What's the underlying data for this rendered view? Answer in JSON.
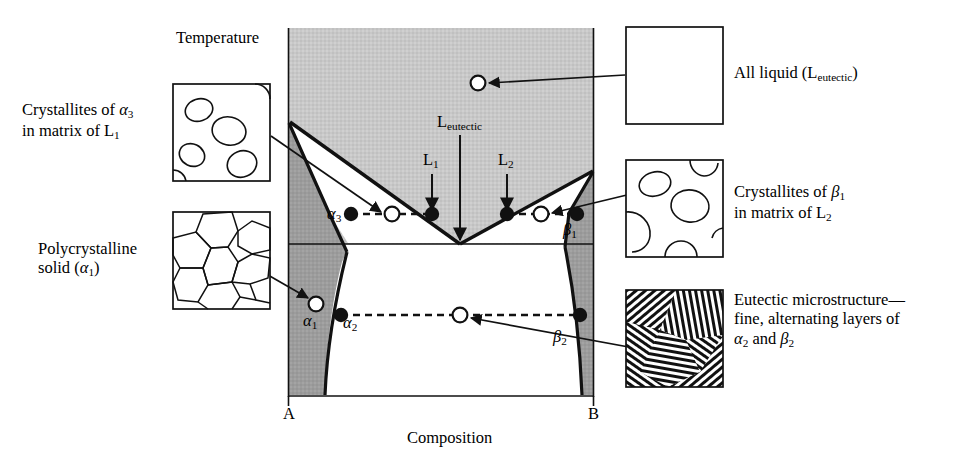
{
  "figure": {
    "type": "eutectic-phase-diagram",
    "axis": {
      "y_title": "Temperature",
      "x_title": "Composition",
      "x_left_tick": "A",
      "x_right_tick": "B"
    },
    "in_diagram_labels": [
      {
        "id": "L_eutectic",
        "base": "L",
        "sub": "eutectic",
        "x": 451,
        "y": 122
      },
      {
        "id": "L1",
        "base": "L",
        "sub": "1",
        "x": 424,
        "y": 160
      },
      {
        "id": "L2",
        "base": "L",
        "sub": "2",
        "x": 500,
        "y": 160
      },
      {
        "id": "alpha3",
        "base": "α",
        "sub": "3",
        "x": 329,
        "y": 207
      },
      {
        "id": "beta1",
        "base": "β",
        "sub": "1",
        "x": 561,
        "y": 225
      },
      {
        "id": "alpha1",
        "base": "α",
        "sub": "1",
        "x": 305,
        "y": 316
      },
      {
        "id": "alpha2",
        "base": "α",
        "sub": "2",
        "x": 345,
        "y": 318
      },
      {
        "id": "beta2",
        "base": "β",
        "sub": "2",
        "x": 552,
        "y": 332
      }
    ],
    "callouts": [
      {
        "id": "all-liquid",
        "side": "right",
        "lines": [
          {
            "text": "All liquid (L",
            "sub": "eutectic",
            "tail": ")"
          }
        ],
        "swatch": "blank",
        "text_x": 733,
        "text_y": 70
      },
      {
        "id": "crystallites-alpha3",
        "side": "left",
        "lines": [
          {
            "text": "Crystallites of ",
            "ital": "α",
            "sub": "3",
            "tail": ""
          },
          {
            "text": "in matrix of L",
            "sub": "1",
            "tail": ""
          }
        ],
        "swatch": "blobs",
        "text_x": 22,
        "text_y": 108
      },
      {
        "id": "polycrystalline-alpha1",
        "side": "left",
        "lines": [
          {
            "text": "Polycrystalline",
            "sub": "",
            "tail": ""
          },
          {
            "text": "solid (",
            "ital": "α",
            "sub": "1",
            "tail": ")"
          }
        ],
        "swatch": "grains",
        "text_x": 38,
        "text_y": 248
      },
      {
        "id": "crystallites-beta1",
        "side": "right",
        "lines": [
          {
            "text": "Crystallites of ",
            "ital": "β",
            "sub": "1",
            "tail": ""
          },
          {
            "text": "in matrix of L",
            "sub": "2",
            "tail": ""
          }
        ],
        "swatch": "blobs2",
        "text_x": 733,
        "text_y": 191
      },
      {
        "id": "eutectic-microstructure",
        "side": "right",
        "lines": [
          {
            "text": "Eutectic microstructure—",
            "sub": "",
            "tail": ""
          },
          {
            "text": "fine, alternating layers of",
            "sub": "",
            "tail": ""
          },
          {
            "text": "α",
            "sub": "2",
            "tail": " and ",
            "ital2": "β",
            "sub2": "2"
          }
        ],
        "swatch": "lamellar",
        "text_x": 733,
        "text_y": 299
      }
    ],
    "colors": {
      "liquid_region": "#c6c6c6",
      "solid_region": "#9b9b9b",
      "two_phase_region": "#ffffff",
      "line": "#111111",
      "background": "#ffffff"
    },
    "points": {
      "filled": [
        {
          "id": "alpha3",
          "x": 351,
          "y": 214
        },
        {
          "id": "L1",
          "x": 432,
          "y": 214
        },
        {
          "id": "L2",
          "x": 507,
          "y": 214
        },
        {
          "id": "beta1",
          "x": 577,
          "y": 214
        },
        {
          "id": "alpha2",
          "x": 341,
          "y": 315
        },
        {
          "id": "beta2",
          "x": 580,
          "y": 315
        }
      ],
      "open": [
        {
          "id": "L_eutectic_overall",
          "x": 478,
          "y": 83
        },
        {
          "id": "alpha3_overall",
          "x": 392,
          "y": 214
        },
        {
          "id": "beta1_overall",
          "x": 541,
          "y": 214
        },
        {
          "id": "alpha1_overall",
          "x": 316,
          "y": 304
        },
        {
          "id": "eutectic_overall",
          "x": 460,
          "y": 315
        }
      ]
    },
    "plot_box": {
      "left": 288,
      "right": 594,
      "top": 28,
      "bottom": 395
    },
    "eutectic": {
      "x": 460,
      "y": 244
    }
  }
}
